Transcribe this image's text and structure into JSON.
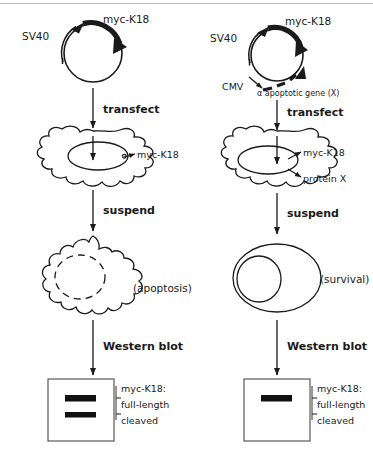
{
  "figure": {
    "ink_color": "#1a1a1a",
    "background_color": "#ffffff",
    "rule_color": "#b9b9b9"
  },
  "columns": [
    {
      "id": "left",
      "condition": "myc-K18 alone",
      "plasmid": {
        "name": "plasmid-myc-K18",
        "promoters": [
          {
            "label": "SV40",
            "style": "thin-arrow"
          }
        ],
        "genes": [
          {
            "label": "myc-K18",
            "style": "thick-arrow"
          }
        ]
      },
      "steps": [
        {
          "label": "transfect"
        },
        {
          "label": "suspend"
        },
        {
          "label": "Western blot"
        }
      ],
      "cell_transfected": {
        "name": "adherent-cell",
        "shape": "amoeboid",
        "products": [
          {
            "label": "myc-K18"
          }
        ]
      },
      "cell_suspended": {
        "name": "apoptotic-cell",
        "shape": "blebbing",
        "nucleus": "fragmented",
        "outcome": "(apoptosis)"
      },
      "blot": {
        "name": "western-blot-apoptosis",
        "bands": [
          {
            "id": "full-length",
            "present": true
          },
          {
            "id": "cleaved",
            "present": true
          }
        ],
        "legend_title": "myc-K18:",
        "legend_items": [
          {
            "label": "full-length"
          },
          {
            "label": "cleaved"
          }
        ]
      }
    },
    {
      "id": "right",
      "condition": "myc-K18 plus anti-apoptotic gene X",
      "plasmid": {
        "name": "plasmid-myc-K18-and-gene-X",
        "promoters": [
          {
            "label": "SV40",
            "style": "thin-arrow"
          },
          {
            "label": "CMV",
            "style": "thin-arrow"
          }
        ],
        "genes": [
          {
            "label": "myc-K18",
            "style": "thick-arrow"
          },
          {
            "label": "α apoptotic gene (X)",
            "style": "dashed-arrow"
          }
        ]
      },
      "steps": [
        {
          "label": "transfect"
        },
        {
          "label": "suspend"
        },
        {
          "label": "Western blot"
        }
      ],
      "cell_transfected": {
        "name": "adherent-cell",
        "shape": "amoeboid",
        "products": [
          {
            "label": "myc-K18"
          },
          {
            "label": "protein X"
          }
        ]
      },
      "cell_suspended": {
        "name": "surviving-cell",
        "shape": "round",
        "nucleus": "intact",
        "outcome": "(survival)"
      },
      "blot": {
        "name": "western-blot-survival",
        "bands": [
          {
            "id": "full-length",
            "present": true
          },
          {
            "id": "cleaved",
            "present": false
          }
        ],
        "legend_title": "myc-K18:",
        "legend_items": [
          {
            "label": "full-length"
          },
          {
            "label": "cleaved"
          }
        ]
      }
    }
  ]
}
